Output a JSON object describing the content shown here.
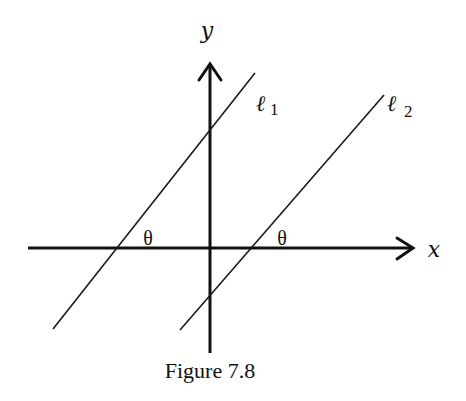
{
  "figure": {
    "caption": "Figure 7.8",
    "axes": {
      "x_label": "x",
      "y_label": "y"
    },
    "lines": [
      {
        "name": "l1",
        "symbol": "ℓ",
        "subscript": "1"
      },
      {
        "name": "l2",
        "symbol": "ℓ",
        "subscript": "2"
      }
    ],
    "angle_labels": [
      "θ",
      "θ"
    ],
    "colors": {
      "ink": "#111111",
      "background": "#ffffff"
    }
  }
}
